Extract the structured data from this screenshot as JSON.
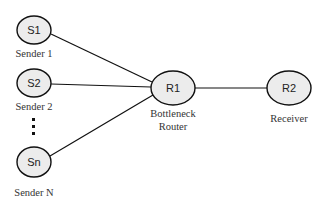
{
  "diagram": {
    "type": "network-topology",
    "nodes": [
      {
        "id": "S1",
        "label": "S1",
        "caption": [
          "Sender 1"
        ],
        "cx": 34,
        "cy": 30,
        "rx": 17,
        "ry": 14
      },
      {
        "id": "S2",
        "label": "S2",
        "caption": [
          "Sender 2"
        ],
        "cx": 34,
        "cy": 83,
        "rx": 17,
        "ry": 14
      },
      {
        "id": "Sn",
        "label": "Sn",
        "caption": [
          "Sender N"
        ],
        "cx": 34,
        "cy": 162,
        "rx": 17,
        "ry": 15
      },
      {
        "id": "R1",
        "label": "R1",
        "caption": [
          "Bottleneck",
          "Router"
        ],
        "cx": 173,
        "cy": 88,
        "rx": 22,
        "ry": 17
      },
      {
        "id": "R2",
        "label": "R2",
        "caption": [
          "Receiver"
        ],
        "cx": 289,
        "cy": 88,
        "rx": 22,
        "ry": 17
      }
    ],
    "edges": [
      {
        "from": "S1",
        "to": "R1"
      },
      {
        "from": "S2",
        "to": "R1"
      },
      {
        "from": "Sn",
        "to": "R1"
      },
      {
        "from": "R1",
        "to": "R2"
      }
    ],
    "ellipsis": {
      "symbol": "vertical-dots",
      "count": 3
    }
  }
}
